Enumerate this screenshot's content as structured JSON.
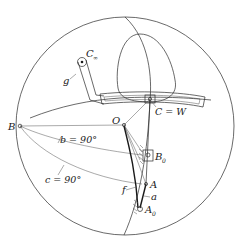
{
  "diagram": {
    "type": "spherical-linkage",
    "labels": {
      "C_inf": "C",
      "C_inf_sub": "∞",
      "g": "g",
      "C_eq_W": "C = W",
      "O": "O",
      "B": "B",
      "b": "b = 90°",
      "c": "c = 90°",
      "B0": "B",
      "B0_sub": "0",
      "A": "A",
      "a": "a",
      "f": "f",
      "A0": "A",
      "A0_sub": "0"
    },
    "colors": {
      "ink": "#1a1a1a",
      "background": "#ffffff"
    }
  }
}
